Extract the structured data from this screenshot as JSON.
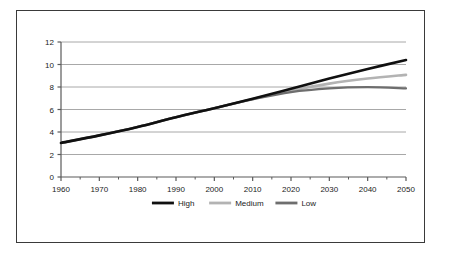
{
  "chart_data": {
    "type": "line",
    "title": "",
    "subtitle": "",
    "xlabel": "",
    "ylabel": "",
    "xlim": [
      1960,
      2050
    ],
    "ylim": [
      0,
      12
    ],
    "grid": true,
    "grid_axis": "y",
    "legend_position": "bottom",
    "x_ticks": [
      "1960",
      "1970",
      "1980",
      "1990",
      "2000",
      "2010",
      "2020",
      "2030",
      "2040",
      "2050"
    ],
    "y_ticks": [
      "0",
      "2",
      "4",
      "6",
      "8",
      "10",
      "12"
    ],
    "minor_x_ticks": true,
    "x": [
      1960,
      1970,
      1980,
      1990,
      2000,
      2010,
      2020,
      2030,
      2040,
      2050
    ],
    "series": [
      {
        "name": "High",
        "color": "#101010",
        "width": 2.6,
        "values": [
          3.03,
          3.7,
          4.45,
          5.32,
          6.12,
          6.96,
          7.85,
          8.75,
          9.6,
          10.4
        ]
      },
      {
        "name": "Medium",
        "color": "#b3b3b3",
        "width": 2.6,
        "values": [
          3.03,
          3.7,
          4.45,
          5.32,
          6.12,
          6.93,
          7.68,
          8.3,
          8.75,
          9.08
        ]
      },
      {
        "name": "Low",
        "color": "#6e6e6e",
        "width": 2.2,
        "values": [
          3.03,
          3.7,
          4.45,
          5.32,
          6.12,
          6.9,
          7.55,
          7.88,
          7.98,
          7.88
        ]
      }
    ]
  },
  "legend": {
    "items": [
      {
        "label": "High",
        "color": "#101010"
      },
      {
        "label": "Medium",
        "color": "#b3b3b3"
      },
      {
        "label": "Low",
        "color": "#6e6e6e"
      }
    ]
  },
  "style": {
    "frame_color": "#3a3a3a",
    "grid_color": "#a8a8a8",
    "axis_color": "#5a5a5a",
    "text_color": "#1b1b1b",
    "background": "#ffffff"
  }
}
